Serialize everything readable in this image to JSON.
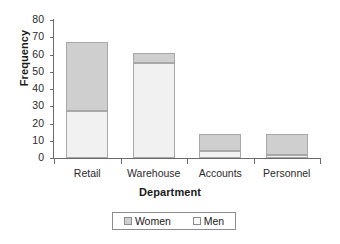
{
  "chart_data": {
    "type": "bar",
    "subtype": "stacked-bar",
    "title": "",
    "xlabel": "Department",
    "ylabel": "Frequency",
    "categories": [
      "Retail",
      "Warehouse",
      "Accounts",
      "Personnel"
    ],
    "series": [
      {
        "name": "Men",
        "values": [
          27,
          55,
          4,
          2
        ],
        "color": "#f1f1f1"
      },
      {
        "name": "Women",
        "values": [
          40,
          6,
          10,
          12
        ],
        "color": "#cfcfcf"
      }
    ],
    "totals": [
      67,
      61,
      14,
      14
    ],
    "ylim": [
      0,
      80
    ],
    "yticks": [
      0,
      10,
      20,
      30,
      40,
      50,
      60,
      70,
      80
    ],
    "ytick_labels": [
      "0",
      "10",
      "20",
      "30",
      "40",
      "50",
      "60",
      "70",
      "80"
    ],
    "grid": false,
    "legend_position": "bottom",
    "legend_entries": [
      "Women",
      "Men"
    ],
    "axis_color": "#6b6b6b",
    "bar_border_color": "#a8a8a8",
    "background": "#ffffff"
  }
}
